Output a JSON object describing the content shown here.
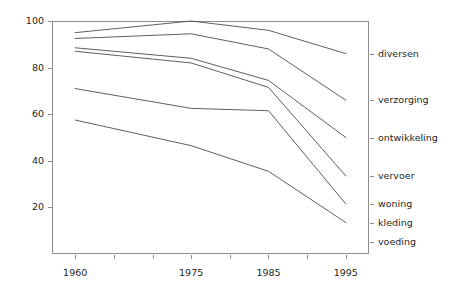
{
  "chart_data": {
    "type": "line",
    "title": "",
    "xlabel": "",
    "ylabel": "",
    "x": [
      1960,
      1975,
      1985,
      1995
    ],
    "xlim": [
      1957,
      1998
    ],
    "ylim": [
      0,
      100
    ],
    "x_tick_labels": [
      "1960",
      "1975",
      "1985",
      "1995"
    ],
    "x_tick_values": [
      1960,
      1975,
      1985,
      1995
    ],
    "x_minor_ticks": [
      1965,
      1970,
      1980,
      1990
    ],
    "y_tick_labels": [
      "20",
      "40",
      "60",
      "80",
      "100"
    ],
    "y_tick_values": [
      20,
      40,
      60,
      80,
      100
    ],
    "grid": false,
    "legend": "right-axis-labels",
    "note": "Cumulative (stacked-style) line chart; each line ends at a labelled category on the right axis.",
    "series": [
      {
        "name": "diversen",
        "values": [
          95.0,
          100.0,
          96.0,
          86.0
        ]
      },
      {
        "name": "verzorging",
        "values": [
          92.5,
          94.5,
          88.0,
          66.0
        ]
      },
      {
        "name": "ontwikkeling",
        "values": [
          88.5,
          84.0,
          74.5,
          50.0
        ]
      },
      {
        "name": "vervoer",
        "values": [
          87.0,
          82.0,
          71.5,
          33.5
        ]
      },
      {
        "name": "woning",
        "values": [
          71.0,
          62.5,
          61.5,
          21.5
        ]
      },
      {
        "name": "kleding",
        "values": [
          57.5,
          46.5,
          35.5,
          13.5
        ]
      },
      {
        "name": "voeding",
        "values": [
          null,
          null,
          null,
          5.0
        ]
      }
    ]
  },
  "axis": {
    "y_ticks": [
      {
        "label": "100",
        "value": 100
      },
      {
        "label": "80",
        "value": 80
      },
      {
        "label": "60",
        "value": 60
      },
      {
        "label": "40",
        "value": 40
      },
      {
        "label": "20",
        "value": 20
      }
    ],
    "x_ticks": [
      {
        "label": "1960",
        "value": 1960
      },
      {
        "label": "1975",
        "value": 1975
      },
      {
        "label": "1985",
        "value": 1985
      },
      {
        "label": "1995",
        "value": 1995
      }
    ]
  },
  "series_labels": [
    {
      "name": "diversen",
      "label": "diversen",
      "value": 86.0
    },
    {
      "name": "verzorging",
      "label": "verzorging",
      "value": 66.0
    },
    {
      "name": "ontwikkeling",
      "label": "ontwikkeling",
      "value": 50.0
    },
    {
      "name": "vervoer",
      "label": "vervoer",
      "value": 33.5
    },
    {
      "name": "woning",
      "label": "woning",
      "value": 21.5
    },
    {
      "name": "kleding",
      "label": "kleding",
      "value": 13.5
    },
    {
      "name": "voeding",
      "label": "voeding",
      "value": 5.0
    }
  ],
  "colors": {
    "line": "#4d4d4d",
    "axis": "#8d8d8d",
    "text": "#231f20",
    "background": "#ffffff"
  }
}
